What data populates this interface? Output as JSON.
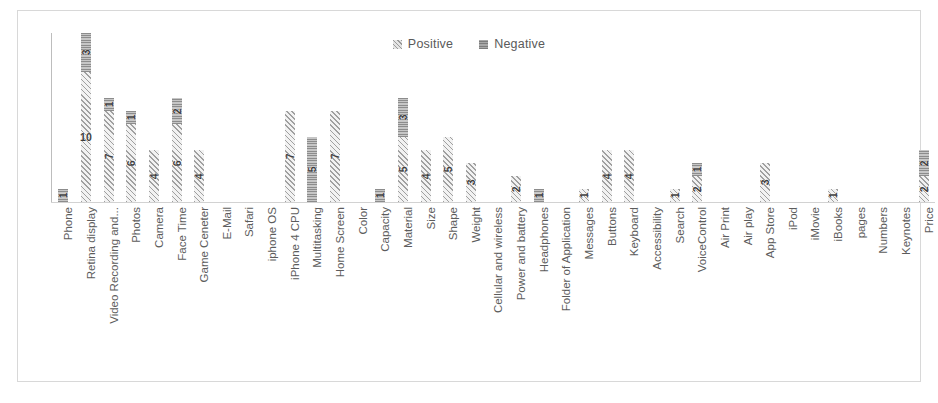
{
  "chart_data": {
    "type": "bar",
    "stacked": true,
    "title": "",
    "subtitle": "",
    "xlabel": "",
    "ylabel": "",
    "grid": false,
    "legend_position": "top-center",
    "ylim": [
      0,
      13
    ],
    "categories": [
      "Phone",
      "Retina display",
      "Video Recording and...",
      "Photos",
      "Camera",
      "Face Time",
      "Game Ceneter",
      "E-Mail",
      "Safari",
      "iphone OS",
      "iPhone 4 CPU",
      "Multitasking",
      "Home Screen",
      "Color",
      "Capacity",
      "Material",
      "Size",
      "Shape",
      "Weight",
      "Cellular and wireless",
      "Power and battery",
      "Headphones",
      "Folder of Application",
      "Messages",
      "Buttons",
      "Keyboard",
      "Accessibility",
      "Search",
      "VoiceControl",
      "Air Print",
      "Air play",
      "App Store",
      "iPod",
      "iMovie",
      "iBooks",
      "pages",
      "Numbers",
      "Keynotes",
      "Price"
    ],
    "series": [
      {
        "name": "Positive",
        "color": "#ededed",
        "pattern": "diagonal-hatch",
        "values": [
          0,
          10,
          7,
          6,
          4,
          6,
          4,
          0,
          0,
          0,
          7,
          0,
          7,
          0,
          0,
          5,
          4,
          5,
          3,
          0,
          2,
          0,
          0,
          1,
          4,
          4,
          0,
          1,
          2,
          0,
          0,
          3,
          0,
          0,
          1,
          0,
          0,
          0,
          2
        ]
      },
      {
        "name": "Negative",
        "color": "#b5b5b5",
        "pattern": "solid-gray",
        "values": [
          1,
          3,
          1,
          1,
          0,
          2,
          0,
          0,
          0,
          0,
          0,
          5,
          0,
          0,
          1,
          3,
          0,
          0,
          0,
          0,
          0,
          1,
          0,
          0,
          0,
          0,
          0,
          0,
          1,
          0,
          0,
          0,
          0,
          0,
          0,
          0,
          0,
          0,
          2
        ]
      }
    ],
    "data_labels": [
      {
        "category": "Phone",
        "positive": null,
        "negative": "1"
      },
      {
        "category": "Retina display",
        "positive": "10",
        "negative": "3"
      },
      {
        "category": "Video Recording and...",
        "positive": "7",
        "negative": "1"
      },
      {
        "category": "Photos",
        "positive": "6",
        "negative": "1"
      },
      {
        "category": "Camera",
        "positive": "4",
        "negative": null
      },
      {
        "category": "Face Time",
        "positive": "6",
        "negative": "2"
      },
      {
        "category": "Game Ceneter",
        "positive": "4",
        "negative": null
      },
      {
        "category": "E-Mail",
        "positive": null,
        "negative": null
      },
      {
        "category": "Safari",
        "positive": null,
        "negative": null
      },
      {
        "category": "iphone OS",
        "positive": null,
        "negative": null
      },
      {
        "category": "iPhone 4 CPU",
        "positive": "7",
        "negative": null
      },
      {
        "category": "Multitasking",
        "positive": null,
        "negative": "5"
      },
      {
        "category": "Home Screen",
        "positive": "7",
        "negative": null
      },
      {
        "category": "Color",
        "positive": null,
        "negative": null
      },
      {
        "category": "Capacity",
        "positive": null,
        "negative": "1"
      },
      {
        "category": "Material",
        "positive": "5",
        "negative": "3"
      },
      {
        "category": "Size",
        "positive": "4",
        "negative": null
      },
      {
        "category": "Shape",
        "positive": "5",
        "negative": null
      },
      {
        "category": "Weight",
        "positive": "3",
        "negative": null
      },
      {
        "category": "Cellular and wireless",
        "positive": null,
        "negative": null
      },
      {
        "category": "Power and battery",
        "positive": "2",
        "negative": null
      },
      {
        "category": "Headphones",
        "positive": null,
        "negative": "1"
      },
      {
        "category": "Folder of Application",
        "positive": null,
        "negative": null
      },
      {
        "category": "Messages",
        "positive": "1",
        "negative": null
      },
      {
        "category": "Buttons",
        "positive": "4",
        "negative": null
      },
      {
        "category": "Keyboard",
        "positive": "4",
        "negative": null
      },
      {
        "category": "Accessibility",
        "positive": null,
        "negative": null
      },
      {
        "category": "Search",
        "positive": "1",
        "negative": null
      },
      {
        "category": "VoiceControl",
        "positive": "2",
        "negative": "1"
      },
      {
        "category": "Air Print",
        "positive": null,
        "negative": null
      },
      {
        "category": "Air play",
        "positive": null,
        "negative": null
      },
      {
        "category": "App Store",
        "positive": "3",
        "negative": null
      },
      {
        "category": "iPod",
        "positive": null,
        "negative": null
      },
      {
        "category": "iMovie",
        "positive": null,
        "negative": null
      },
      {
        "category": "iBooks",
        "positive": "1",
        "negative": null
      },
      {
        "category": "pages",
        "positive": null,
        "negative": null
      },
      {
        "category": "Numbers",
        "positive": null,
        "negative": null
      },
      {
        "category": "Keynotes",
        "positive": null,
        "negative": null
      },
      {
        "category": "Price",
        "positive": "2",
        "negative": "2"
      }
    ]
  },
  "legend": {
    "items": [
      {
        "label": "Positive",
        "swatch": "positive-hatch-swatch"
      },
      {
        "label": "Negative",
        "swatch": "negative-solid-swatch"
      }
    ]
  }
}
